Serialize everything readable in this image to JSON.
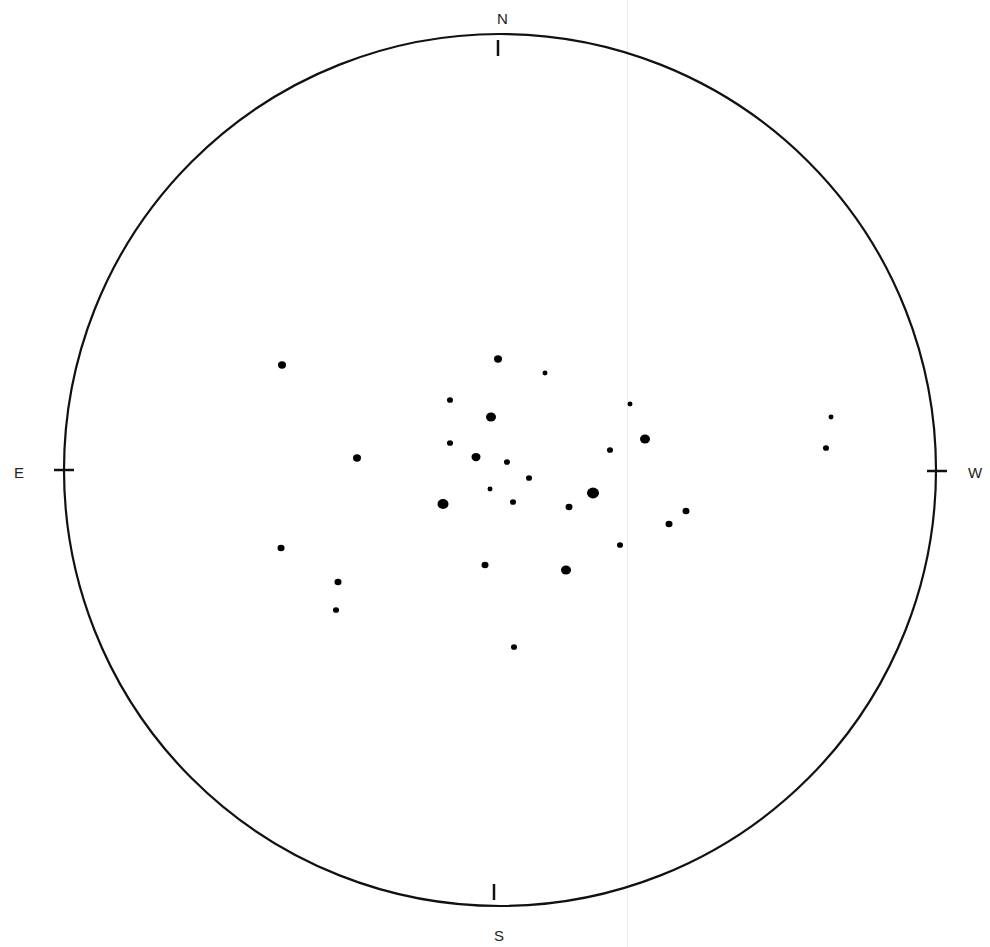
{
  "chart_data": {
    "type": "scatter",
    "subtype": "stereonet-pole-plot",
    "title": "",
    "net": {
      "center": [
        500,
        470
      ],
      "radius": 436,
      "stroke": "#111111"
    },
    "direction_labels": {
      "north": "N",
      "south": "S",
      "east": "E",
      "west": "W"
    },
    "label_positions": {
      "north": [
        497,
        11
      ],
      "south": [
        494,
        928
      ],
      "east": [
        14,
        465
      ],
      "west": [
        968,
        465
      ]
    },
    "ticks": [
      {
        "dir": "N",
        "x": 498,
        "y": 48
      },
      {
        "dir": "S",
        "x": 494,
        "y": 892
      },
      {
        "dir": "E",
        "x": 64,
        "y": 470
      },
      {
        "dir": "W",
        "x": 937,
        "y": 471
      }
    ],
    "points": [
      {
        "x": 282,
        "y": 365,
        "r": 4
      },
      {
        "x": 357,
        "y": 458,
        "r": 4
      },
      {
        "x": 498,
        "y": 359,
        "r": 4
      },
      {
        "x": 545,
        "y": 373,
        "r": 2.5
      },
      {
        "x": 450,
        "y": 400,
        "r": 3
      },
      {
        "x": 491,
        "y": 417,
        "r": 5
      },
      {
        "x": 630,
        "y": 404,
        "r": 2.5
      },
      {
        "x": 645,
        "y": 439,
        "r": 5
      },
      {
        "x": 450,
        "y": 443,
        "r": 3
      },
      {
        "x": 476,
        "y": 457,
        "r": 4.5
      },
      {
        "x": 507,
        "y": 462,
        "r": 3
      },
      {
        "x": 610,
        "y": 450,
        "r": 3
      },
      {
        "x": 529,
        "y": 478,
        "r": 3
      },
      {
        "x": 490,
        "y": 489,
        "r": 2.5
      },
      {
        "x": 513,
        "y": 502,
        "r": 3
      },
      {
        "x": 443,
        "y": 504,
        "r": 5.5
      },
      {
        "x": 593,
        "y": 493,
        "r": 6
      },
      {
        "x": 569,
        "y": 507,
        "r": 3.5
      },
      {
        "x": 686,
        "y": 511,
        "r": 3.5
      },
      {
        "x": 669,
        "y": 524,
        "r": 3.5
      },
      {
        "x": 620,
        "y": 545,
        "r": 3
      },
      {
        "x": 281,
        "y": 548,
        "r": 3.5
      },
      {
        "x": 485,
        "y": 565,
        "r": 3.5
      },
      {
        "x": 566,
        "y": 570,
        "r": 5
      },
      {
        "x": 338,
        "y": 582,
        "r": 3.5
      },
      {
        "x": 336,
        "y": 610,
        "r": 3
      },
      {
        "x": 514,
        "y": 647,
        "r": 3
      },
      {
        "x": 831,
        "y": 417,
        "r": 2.5
      },
      {
        "x": 826,
        "y": 448,
        "r": 3
      }
    ],
    "point_color": "#000000",
    "point_count": 29
  }
}
